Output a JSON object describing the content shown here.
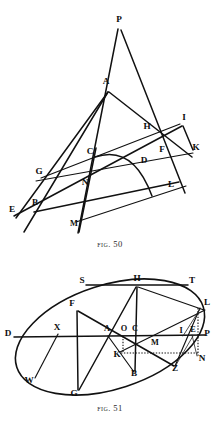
{
  "plate": {
    "title": "Geometric construction plate",
    "background_color": "#ffffff",
    "ink_color": "#111111"
  },
  "figures": [
    {
      "id": "fig50",
      "caption_prefix": "Fig.",
      "caption_number": "50",
      "caption_text": "Fig. 50",
      "description": "Triangle and transversal construction with an arc through C and D",
      "point_labels": [
        "P",
        "A",
        "I",
        "H",
        "K",
        "C",
        "F",
        "D",
        "G",
        "N",
        "L",
        "B",
        "E",
        "M"
      ]
    },
    {
      "id": "fig51",
      "caption_prefix": "Fig.",
      "caption_number": "51",
      "caption_text": "Fig. 51",
      "description": "Ellipse with conjugate diameters, tangent line S-T and auxiliary construction at the right vertex",
      "point_labels": [
        "S",
        "H",
        "T",
        "F",
        "L",
        "D",
        "X",
        "A",
        "O",
        "C",
        "I",
        "E",
        "P",
        "M",
        "K",
        "N",
        "B",
        "Z",
        "W",
        "G"
      ]
    }
  ],
  "fig50": {
    "points": {
      "P": {
        "label": "P",
        "x": 119,
        "y": 22
      },
      "A": {
        "label": "A",
        "x": 106,
        "y": 84
      },
      "I": {
        "label": "I",
        "x": 184,
        "y": 120
      },
      "H": {
        "label": "H",
        "x": 147,
        "y": 129
      },
      "K": {
        "label": "K",
        "x": 196,
        "y": 150
      },
      "C": {
        "label": "C",
        "x": 90,
        "y": 154
      },
      "F": {
        "label": "F",
        "x": 162,
        "y": 152
      },
      "D": {
        "label": "D",
        "x": 144,
        "y": 163
      },
      "G": {
        "label": "G",
        "x": 39,
        "y": 174
      },
      "N": {
        "label": "N",
        "x": 85,
        "y": 185
      },
      "L": {
        "label": "L",
        "x": 171,
        "y": 187
      },
      "B": {
        "label": "B",
        "x": 35,
        "y": 205
      },
      "E": {
        "label": "E",
        "x": 12,
        "y": 212
      },
      "M": {
        "label": "M",
        "x": 74,
        "y": 226
      }
    }
  },
  "fig51": {
    "points": {
      "S": {
        "label": "S",
        "x": 82,
        "y": 283
      },
      "H": {
        "label": "H",
        "x": 137,
        "y": 281
      },
      "T": {
        "label": "T",
        "x": 192,
        "y": 283
      },
      "F": {
        "label": "F",
        "x": 72,
        "y": 306
      },
      "L": {
        "label": "L",
        "x": 207,
        "y": 305
      },
      "D": {
        "label": "D",
        "x": 8,
        "y": 336
      },
      "X": {
        "label": "X",
        "x": 57,
        "y": 330
      },
      "A": {
        "label": "A",
        "x": 107,
        "y": 331
      },
      "O": {
        "label": "O",
        "x": 124,
        "y": 331
      },
      "C": {
        "label": "C",
        "x": 135,
        "y": 331
      },
      "I": {
        "label": "I",
        "x": 181,
        "y": 333
      },
      "E": {
        "label": "E",
        "x": 193,
        "y": 332
      },
      "P": {
        "label": "P",
        "x": 207,
        "y": 336
      },
      "M": {
        "label": "M",
        "x": 155,
        "y": 345
      },
      "K": {
        "label": "K",
        "x": 117,
        "y": 357
      },
      "N": {
        "label": "N",
        "x": 202,
        "y": 361
      },
      "B": {
        "label": "B",
        "x": 134,
        "y": 376
      },
      "Z": {
        "label": "Z",
        "x": 175,
        "y": 371
      },
      "W": {
        "label": "W",
        "x": 29,
        "y": 383
      },
      "G": {
        "label": "G",
        "x": 74,
        "y": 396
      }
    }
  }
}
